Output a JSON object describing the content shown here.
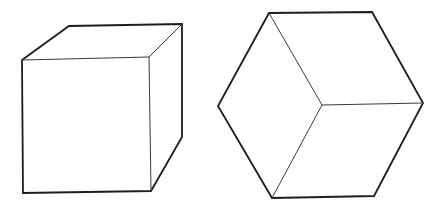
{
  "figure": {
    "background": "#ffffff",
    "stroke_color": "#1e1e1e"
  },
  "cubes": [
    {
      "name": "oblique-cube",
      "front_face": [
        [
          22,
          60
        ],
        [
          149,
          57
        ],
        [
          151,
          191
        ],
        [
          23,
          193
        ]
      ],
      "back_top_left": [
        69,
        26
      ],
      "back_top_right": [
        182,
        24
      ],
      "back_bottom_right": [
        182,
        137
      ]
    },
    {
      "name": "isometric-cube",
      "hexagon": [
        [
          269,
          13
        ],
        [
          372,
          12
        ],
        [
          423,
          103
        ],
        [
          374,
          196
        ],
        [
          272,
          198
        ],
        [
          218,
          106
        ]
      ],
      "center": [
        322,
        105
      ]
    }
  ]
}
